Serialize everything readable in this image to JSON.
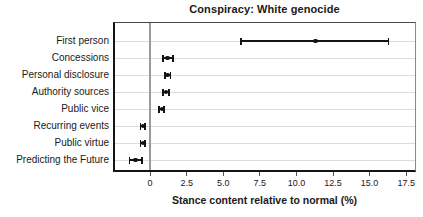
{
  "title": "Conspiracy: White genocide",
  "chart_data": {
    "type": "scatter",
    "subtype": "dot-plot-with-error-bars",
    "title": "Conspiracy: White genocide",
    "xlabel": "Stance content relative to normal (%)",
    "ylabel": "",
    "categories": [
      "First person",
      "Concessions",
      "Personal disclosure",
      "Authority sources",
      "Public vice",
      "Recurring events",
      "Public virtue",
      "Predicting the Future"
    ],
    "values": [
      11.3,
      1.2,
      1.2,
      1.1,
      0.8,
      -0.5,
      -0.5,
      -1.0
    ],
    "ci_low": [
      6.2,
      0.9,
      1.0,
      0.9,
      0.6,
      -0.65,
      -0.65,
      -1.4
    ],
    "ci_high": [
      16.3,
      1.55,
      1.4,
      1.3,
      0.95,
      -0.35,
      -0.35,
      -0.55
    ],
    "xticks": [
      0,
      2.5,
      5.0,
      7.5,
      10.0,
      12.5,
      15.0,
      17.5
    ],
    "xtick_labels": [
      "0",
      "2.5",
      "5.0",
      "7.5",
      "10.0",
      "12.5",
      "15.0",
      "17.5"
    ],
    "xlim": [
      -2.4,
      18.1
    ],
    "grid": "horizontal",
    "zero_line": true,
    "legend": "none",
    "colors": {
      "marker": "#141414",
      "error_bar": "#141414",
      "grid": "#dcdcdc",
      "zero_line": "#9a9a9a",
      "spine": "#141414",
      "text": "#1a1a1a",
      "background": "#ffffff"
    }
  }
}
